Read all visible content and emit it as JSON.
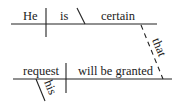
{
  "diagram": {
    "type": "sentence-diagram",
    "main_clause": {
      "subject": "He",
      "verb": "is",
      "predicate_adjective": "certain"
    },
    "connector": "that",
    "subordinate_clause": {
      "subject": "request",
      "modifier": "his",
      "verb": "will be granted"
    },
    "colors": {
      "line": "#222222",
      "text": "#222222",
      "background": "#ffffff"
    }
  }
}
